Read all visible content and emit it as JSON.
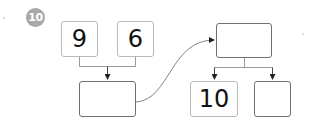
{
  "problem": {
    "number_label": "10",
    "badge_color": "#a8a8a8"
  },
  "left_group": {
    "top_boxes": [
      {
        "value": "9"
      },
      {
        "value": "6"
      }
    ],
    "result_box": {
      "value": ""
    }
  },
  "right_group": {
    "top_box": {
      "value": ""
    },
    "bottom_boxes": [
      {
        "value": "10"
      },
      {
        "value": ""
      }
    ]
  },
  "colors": {
    "connector": "#9a9a9a",
    "arrow": "#222222",
    "curve": "#777777",
    "number_box_border": "#b9b9b9",
    "empty_box_border": "#6f6f6f"
  }
}
